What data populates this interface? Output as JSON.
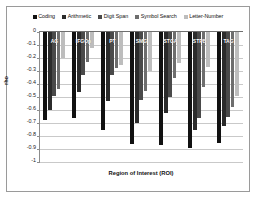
{
  "chart_data": {
    "type": "bar",
    "title": "",
    "xlabel": "Region of Interest (ROI)",
    "ylabel": "rho",
    "ylim": [
      -1,
      0
    ],
    "grid": true,
    "legend_position": "top",
    "categories": [
      "AG",
      "IFGOp",
      "PT",
      "SMG",
      "STGA",
      "STPB",
      "TAG"
    ],
    "ytick_labels": [
      "0",
      "-0.1",
      "-0.2",
      "-0.3",
      "-0.4",
      "-0.5",
      "-0.6",
      "-0.7",
      "-0.8",
      "-0.9",
      "-1"
    ],
    "ytick_values": [
      0,
      -0.1,
      -0.2,
      -0.3,
      -0.4,
      -0.5,
      -0.6,
      -0.7,
      -0.8,
      -0.9,
      -1
    ],
    "series": [
      {
        "name": "Coding",
        "color": "#111111",
        "values": [
          -0.68,
          -0.66,
          -0.75,
          -0.86,
          -0.87,
          -0.89,
          -0.85
        ]
      },
      {
        "name": "Arithmetic",
        "color": "#2b2b2b",
        "values": [
          -0.6,
          -0.46,
          -0.53,
          -0.7,
          -0.62,
          -0.75,
          -0.72
        ]
      },
      {
        "name": "Digit Span",
        "color": "#4a4a4a",
        "values": [
          -0.49,
          -0.33,
          -0.33,
          -0.52,
          -0.5,
          -0.66,
          -0.65
        ]
      },
      {
        "name": "Symbol Search",
        "color": "#6e6e6e",
        "values": [
          -0.44,
          -0.23,
          -0.28,
          -0.45,
          -0.35,
          -0.42,
          -0.58
        ]
      },
      {
        "name": "Letter-Number",
        "color": "#bdbdbd",
        "values": [
          -0.2,
          -0.12,
          -0.25,
          -0.3,
          -0.24,
          -0.27,
          -0.49
        ]
      }
    ]
  },
  "legend": {
    "items": [
      {
        "label": "Coding"
      },
      {
        "label": "Arithmetic"
      },
      {
        "label": "Digit Span"
      },
      {
        "label": "Symbol Search"
      },
      {
        "label": "Letter-Number"
      }
    ]
  },
  "axes": {
    "y_title": "rho",
    "x_title": "Region of Interest (ROI)"
  }
}
